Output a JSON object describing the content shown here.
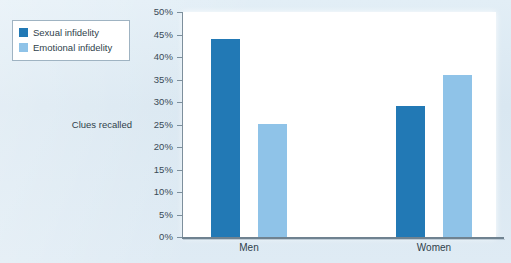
{
  "chart_data": {
    "type": "bar",
    "title": "",
    "subtitle": "",
    "xlabel": "",
    "ylabel": "Clues recalled",
    "categories": [
      "Men",
      "Women"
    ],
    "series": [
      {
        "name": "Sexual infidelity",
        "color": "#2279b5",
        "values": [
          44,
          29
        ]
      },
      {
        "name": "Emotional infidelity",
        "color": "#8fc3e8",
        "values": [
          25,
          36
        ]
      }
    ],
    "grouped_values": {
      "Men": {
        "Sexual infidelity": 44,
        "Emotional infidelity": 29
      },
      "Women": {
        "Sexual infidelity": 25,
        "Emotional infidelity": 36
      }
    },
    "ylim": [
      0,
      50
    ],
    "ytick_step": 5,
    "ytick_labels": [
      "50%",
      "45%",
      "40%",
      "35%",
      "30%",
      "25%",
      "20%",
      "15%",
      "10%",
      "5%",
      "0%"
    ],
    "ytick_values": [
      50,
      45,
      40,
      35,
      30,
      25,
      20,
      15,
      10,
      5,
      0
    ],
    "grid": false,
    "legend_position": "top-left-outside",
    "value_unit": "%"
  },
  "legend": {
    "items": [
      {
        "label": "Sexual infidelity",
        "color": "#2279b5"
      },
      {
        "label": "Emotional infidelity",
        "color": "#8fc3e8"
      }
    ]
  },
  "axis": {
    "y_title": "Clues recalled",
    "ticks": [
      {
        "label": "50%",
        "value": 50
      },
      {
        "label": "45%",
        "value": 45
      },
      {
        "label": "40%",
        "value": 40
      },
      {
        "label": "35%",
        "value": 35
      },
      {
        "label": "30%",
        "value": 30
      },
      {
        "label": "25%",
        "value": 25
      },
      {
        "label": "20%",
        "value": 20
      },
      {
        "label": "15%",
        "value": 15
      },
      {
        "label": "10%",
        "value": 10
      },
      {
        "label": "5%",
        "value": 5
      },
      {
        "label": "0%",
        "value": 0
      }
    ],
    "categories": [
      "Men",
      "Women"
    ]
  },
  "colors": {
    "page_background": "#dce9f2",
    "plot_background": "#ffffff",
    "series_dark": "#2279b5",
    "series_light": "#8fc3e8",
    "axis_line": "#7d8f9c",
    "text": "#2f3f4b"
  }
}
